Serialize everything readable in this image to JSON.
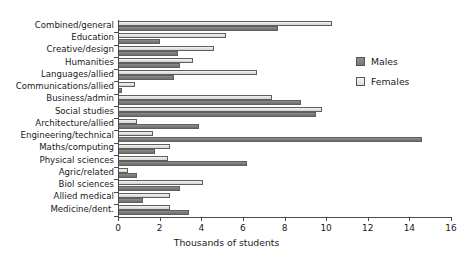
{
  "chart_data": {
    "type": "bar",
    "orientation": "horizontal",
    "title": "",
    "xlabel": "Thousands of students",
    "ylabel": "",
    "xlim": [
      0,
      16
    ],
    "xticks": [
      0,
      2,
      4,
      6,
      8,
      10,
      12,
      14,
      16
    ],
    "grid": false,
    "legend_position": "right",
    "categories": [
      "Combined/general",
      "Education",
      "Creative/design",
      "Humanities",
      "Languages/allied",
      "Communications/allied",
      "Business/admin",
      "Social studies",
      "Architecture/allied",
      "Engineering/technical",
      "Maths/computing",
      "Physical sciences",
      "Agric/related",
      "Biol sciences",
      "Allied medical",
      "Medicine/dent."
    ],
    "series": [
      {
        "name": "Females",
        "color": "#e2e2e2",
        "values": [
          10.3,
          5.2,
          4.6,
          3.6,
          6.7,
          0.8,
          7.4,
          9.8,
          0.9,
          1.7,
          2.5,
          2.4,
          0.5,
          4.1,
          2.5,
          2.5
        ]
      },
      {
        "name": "Males",
        "color": "#7a7a7a",
        "values": [
          7.7,
          2.0,
          2.9,
          3.0,
          2.7,
          0.2,
          8.8,
          9.5,
          3.9,
          14.6,
          1.8,
          6.2,
          0.9,
          3.0,
          1.2,
          3.4
        ]
      }
    ]
  },
  "legend": {
    "items": [
      {
        "label": "Males",
        "swatch": "males"
      },
      {
        "label": "Females",
        "swatch": "females"
      }
    ]
  }
}
